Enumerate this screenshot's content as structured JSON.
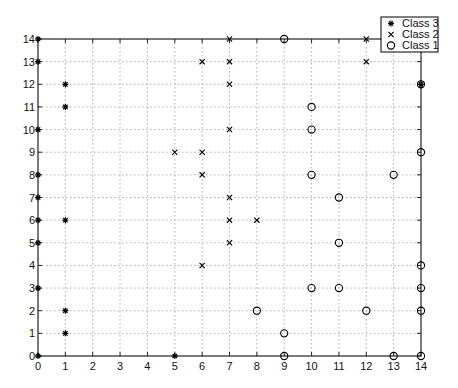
{
  "chart_data": {
    "type": "scatter",
    "title": "",
    "xlabel": "",
    "ylabel": "",
    "xlim": [
      0,
      14
    ],
    "ylim": [
      0,
      14
    ],
    "grid": true,
    "legend_position": "upper-right",
    "x_ticks": [
      0,
      1,
      2,
      3,
      4,
      5,
      6,
      7,
      8,
      9,
      10,
      11,
      12,
      13,
      14
    ],
    "y_ticks": [
      0,
      1,
      2,
      3,
      4,
      5,
      6,
      7,
      8,
      9,
      10,
      11,
      12,
      13,
      14
    ],
    "series": [
      {
        "name": "Class 3",
        "marker": "star",
        "color": "#000000",
        "points": [
          [
            0,
            14
          ],
          [
            0,
            13
          ],
          [
            0,
            10
          ],
          [
            0,
            8
          ],
          [
            0,
            7
          ],
          [
            0,
            6
          ],
          [
            0,
            5
          ],
          [
            0,
            3
          ],
          [
            0,
            0
          ],
          [
            1,
            12
          ],
          [
            1,
            11
          ],
          [
            1,
            6
          ],
          [
            1,
            2
          ],
          [
            1,
            1
          ],
          [
            5,
            0
          ],
          [
            14,
            12
          ]
        ]
      },
      {
        "name": "Class 2",
        "marker": "x",
        "color": "#000000",
        "points": [
          [
            7,
            14
          ],
          [
            6,
            13
          ],
          [
            7,
            13
          ],
          [
            12,
            14
          ],
          [
            12,
            13
          ],
          [
            7,
            12
          ],
          [
            7,
            10
          ],
          [
            5,
            9
          ],
          [
            6,
            9
          ],
          [
            6,
            8
          ],
          [
            7,
            7
          ],
          [
            7,
            6
          ],
          [
            8,
            6
          ],
          [
            7,
            5
          ],
          [
            6,
            4
          ]
        ]
      },
      {
        "name": "Class 1",
        "marker": "circle",
        "color": "#000000",
        "points": [
          [
            9,
            14
          ],
          [
            14,
            12
          ],
          [
            10,
            11
          ],
          [
            10,
            10
          ],
          [
            14,
            9
          ],
          [
            10,
            8
          ],
          [
            13,
            8
          ],
          [
            11,
            7
          ],
          [
            11,
            5
          ],
          [
            14,
            4
          ],
          [
            10,
            3
          ],
          [
            11,
            3
          ],
          [
            14,
            3
          ],
          [
            8,
            2
          ],
          [
            12,
            2
          ],
          [
            14,
            2
          ],
          [
            9,
            1
          ],
          [
            9,
            0
          ],
          [
            13,
            0
          ],
          [
            14,
            0
          ]
        ]
      }
    ]
  },
  "legend": {
    "items": [
      {
        "label": "Class 3",
        "marker": "star"
      },
      {
        "label": "Class 2",
        "marker": "x"
      },
      {
        "label": "Class 1",
        "marker": "circle"
      }
    ]
  }
}
